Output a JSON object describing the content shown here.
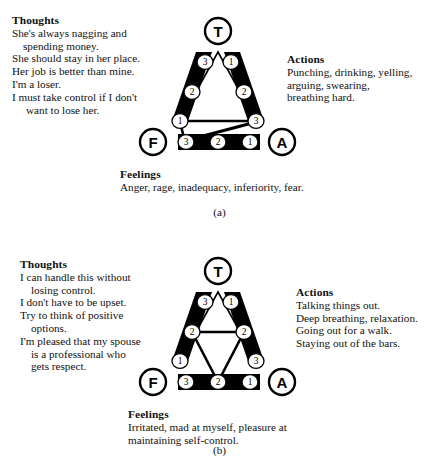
{
  "figure": {
    "panels": [
      {
        "id": "a",
        "caption": "(a)",
        "thoughts": {
          "heading": "Thoughts",
          "lines": [
            "She's always nagging and",
            "spending money.",
            "She should stay in her place.",
            "Her job is better than mine.",
            "I'm a loser.",
            "I must take control if I don't",
            "want to lose her."
          ]
        },
        "actions": {
          "heading": "Actions",
          "lines": [
            "Punching, drinking, yelling,",
            "arguing, swearing,",
            "breathing hard."
          ]
        },
        "feelings": {
          "heading": "Feelings",
          "lines": [
            "Anger, rage, inadequacy, inferiority, fear."
          ]
        },
        "vertices": {
          "top": "T",
          "left": "F",
          "right": "A"
        },
        "edge_labels": {
          "left_top": "3",
          "left_mid": "2",
          "left_bottom": "1",
          "right_top": "1",
          "right_mid": "2",
          "right_bottom": "3",
          "bottom_left": "3",
          "bottom_mid": "2",
          "bottom_right": "1"
        }
      },
      {
        "id": "b",
        "caption": "(b)",
        "thoughts": {
          "heading": "Thoughts",
          "lines": [
            "I can handle this without",
            "losing control.",
            "I don't have to be upset.",
            "Try to think of positive",
            "options.",
            "I'm pleased that my spouse",
            "is a professional who",
            "gets respect."
          ]
        },
        "actions": {
          "heading": "Actions",
          "lines": [
            "Talking things out.",
            "Deep breathing, relaxation.",
            "Going out for a walk.",
            "Staying out of the bars."
          ]
        },
        "feelings": {
          "heading": "Feelings",
          "lines": [
            "Irritated, mad at myself, pleasure at",
            "maintaining self-control."
          ]
        },
        "vertices": {
          "top": "T",
          "left": "F",
          "right": "A"
        },
        "edge_labels": {
          "left_top": "3",
          "left_mid": "2",
          "left_bottom": "1",
          "right_top": "1",
          "right_mid": "2",
          "right_bottom": "3",
          "bottom_left": "3",
          "bottom_mid": "2",
          "bottom_right": "1"
        }
      }
    ],
    "colors": {
      "ink": "#000000",
      "paper": "#ffffff"
    }
  }
}
